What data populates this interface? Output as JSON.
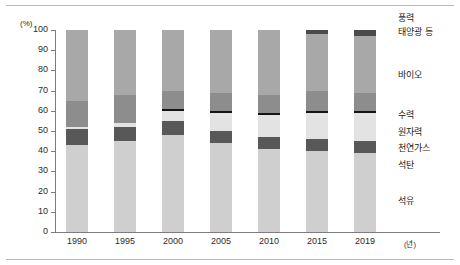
{
  "chart_data": {
    "type": "bar",
    "stacked": true,
    "title": "",
    "xlabel": "년",
    "ylabel": "(%)",
    "ylim": [
      0,
      100
    ],
    "yticks": [
      "0",
      "10",
      "20",
      "30",
      "40",
      "50",
      "60",
      "70",
      "80",
      "90",
      "100"
    ],
    "grid": false,
    "legend_position": "right",
    "categories": [
      "1990",
      "1995",
      "2000",
      "2005",
      "2010",
      "2015",
      "2019"
    ],
    "series": [
      {
        "name": "석유",
        "color": "#cfcfcf",
        "values": [
          43,
          45,
          48,
          44,
          41,
          40,
          39
        ]
      },
      {
        "name": "석탄",
        "color": "#585858",
        "values": [
          8,
          7,
          7,
          6,
          6,
          6,
          6
        ]
      },
      {
        "name": "천연가스",
        "color": "#e3e3e3",
        "values": [
          1,
          2,
          5,
          9,
          11,
          13,
          14
        ]
      },
      {
        "name": "원자력",
        "color": "#141414",
        "values": [
          0,
          0,
          1,
          1,
          1,
          1,
          1
        ]
      },
      {
        "name": "수력",
        "color": "#8d8d8d",
        "values": [
          13,
          14,
          9,
          9,
          9,
          10,
          9
        ]
      },
      {
        "name": "바이오",
        "color": "#a8a8a8",
        "values": [
          35,
          32,
          30,
          31,
          32,
          28,
          28
        ]
      },
      {
        "name": "태양광 등",
        "color": "#4a4a4a",
        "values": [
          0,
          0,
          0,
          0,
          0,
          2,
          3
        ]
      },
      {
        "name": "풍력",
        "color": "#6e6e6e",
        "values": [
          0,
          0,
          0,
          0,
          0,
          0,
          0
        ]
      }
    ]
  },
  "legend": {
    "entries": [
      {
        "label": "풍력"
      },
      {
        "label": "태양광 등"
      },
      {
        "label": "바이오"
      },
      {
        "label": "수력"
      },
      {
        "label": "원자력"
      },
      {
        "label": "천연가스"
      },
      {
        "label": "석탄"
      },
      {
        "label": "석유"
      }
    ]
  },
  "axes": {
    "y_unit": "(%)",
    "x_unit": "(년)"
  }
}
